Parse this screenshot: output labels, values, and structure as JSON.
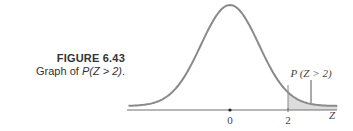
{
  "caption": {
    "figure_number": "FIGURE 6.43",
    "text_prefix": "Graph of ",
    "text_math": "P(Z > 2)",
    "text_suffix": "."
  },
  "chart_data": {
    "type": "area",
    "title": "Graph of P(Z > 2)",
    "xlabel": "Z",
    "ylabel": "",
    "x_ticks": [
      {
        "value": 0,
        "label": "0"
      },
      {
        "value": 2,
        "label": "2"
      }
    ],
    "xlim": [
      -3.5,
      3.7
    ],
    "shaded_region": {
      "from": 2,
      "to": 3.7,
      "label": "P (Z > 2)"
    },
    "grid": false,
    "legend": null,
    "curve": "standard normal pdf",
    "colors": {
      "curve": "#808080",
      "shade": "#d9d9d9",
      "axis": "#707070"
    }
  },
  "graph": {
    "axis_label": "Z",
    "tick_0": "0",
    "tick_2": "2",
    "tail_label": "P (Z > 2)"
  }
}
